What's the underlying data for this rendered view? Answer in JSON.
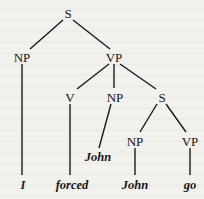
{
  "tree": {
    "nodes": {
      "s_root": "S",
      "np_subject": "NP",
      "vp_main": "VP",
      "v": "V",
      "np_object": "NP",
      "s_embedded": "S",
      "np_embedded": "NP",
      "vp_embedded": "VP"
    },
    "leaves": {
      "i": "I",
      "forced": "forced",
      "john_object": "John",
      "john_embedded": "John",
      "go": "go"
    }
  }
}
